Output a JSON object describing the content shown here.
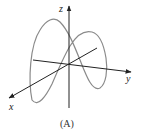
{
  "figure": {
    "caption": "(A)",
    "axes": {
      "x_label": "x",
      "y_label": "y",
      "z_label": "z"
    },
    "colors": {
      "axis": "#222222",
      "curve": "#8a8a8a",
      "background": "#ffffff"
    }
  }
}
